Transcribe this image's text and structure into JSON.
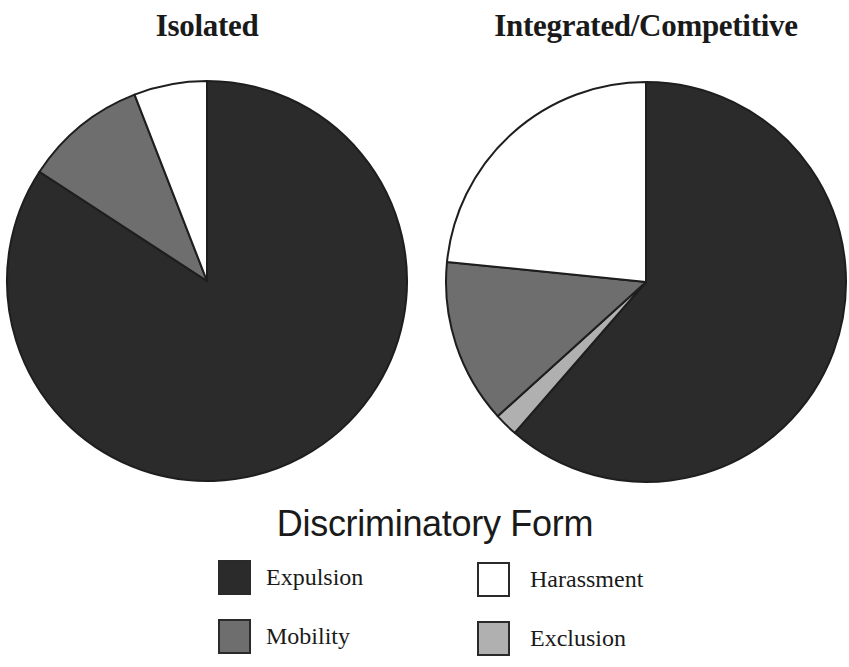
{
  "chart_data": {
    "type": "pie",
    "legend_title": "Discriminatory Form",
    "legend_position": "bottom",
    "categories": [
      "Expulsion",
      "Exclusion",
      "Mobility",
      "Harassment"
    ],
    "colors": {
      "Expulsion": "#2b2b2b",
      "Exclusion": "#b0b0b0",
      "Mobility": "#6e6e6e",
      "Harassment": "#ffffff"
    },
    "pies": [
      {
        "title": "Isolated",
        "values": [
          84.2,
          0,
          9.9,
          5.9
        ]
      },
      {
        "title": "Integrated/Competitive",
        "values": [
          61.4,
          1.9,
          13.3,
          23.4
        ]
      }
    ],
    "unit": "percent (estimated from slice angles)"
  },
  "titles": {
    "left": "Isolated",
    "right": "Integrated/Competitive"
  },
  "legend": {
    "title": "Discriminatory Form",
    "items": [
      {
        "label": "Expulsion",
        "color": "#2b2b2b"
      },
      {
        "label": "Mobility",
        "color": "#6e6e6e"
      },
      {
        "label": "Harassment",
        "color": "#ffffff"
      },
      {
        "label": "Exclusion",
        "color": "#b0b0b0"
      }
    ]
  }
}
